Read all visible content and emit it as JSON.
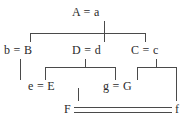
{
  "diagram": {
    "type": "pedigree-chart",
    "generations": [
      {
        "level": 1,
        "nodes": [
          {
            "id": "A",
            "label": "A = a",
            "left_allele": "A",
            "right_allele": "a"
          }
        ]
      },
      {
        "level": 2,
        "nodes": [
          {
            "id": "B",
            "label": "b = B",
            "left_allele": "b",
            "right_allele": "B"
          },
          {
            "id": "D",
            "label": "D = d",
            "left_allele": "D",
            "right_allele": "d"
          },
          {
            "id": "C",
            "label": "C = c",
            "left_allele": "C",
            "right_allele": "c"
          }
        ]
      },
      {
        "level": 3,
        "nodes": [
          {
            "id": "E",
            "label": "e = E",
            "left_allele": "e",
            "right_allele": "E"
          },
          {
            "id": "G",
            "label": "g = G",
            "left_allele": "g",
            "right_allele": "G"
          }
        ]
      },
      {
        "level": 4,
        "nodes": [
          {
            "id": "F",
            "label": "F",
            "right_label": "f",
            "link": "double-line"
          }
        ]
      }
    ],
    "labels": {
      "a_node": "A = a",
      "b_node": "b = B",
      "d_node": "D = d",
      "c_node": "C = c",
      "e_node": "e = E",
      "g_node": "g = G",
      "f_left": "F",
      "f_right": "f"
    },
    "colors": {
      "line": "#4a4a4a",
      "text": "#2b2b2b",
      "background": "#ffffff"
    }
  }
}
